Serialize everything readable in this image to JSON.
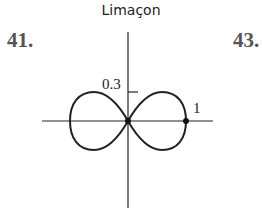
{
  "title": "Limaçon",
  "problem_left": "41.",
  "problem_right": "43.",
  "labels": {
    "y_tick": "0.3",
    "x_point": "1"
  },
  "figure": {
    "type": "polar-curve",
    "shape": "figure-eight (lemniscate-like)",
    "x_extent": [
      -1,
      1
    ],
    "y_tick_value": 0.3,
    "marked_points": [
      "origin",
      "(1, 0)"
    ]
  }
}
